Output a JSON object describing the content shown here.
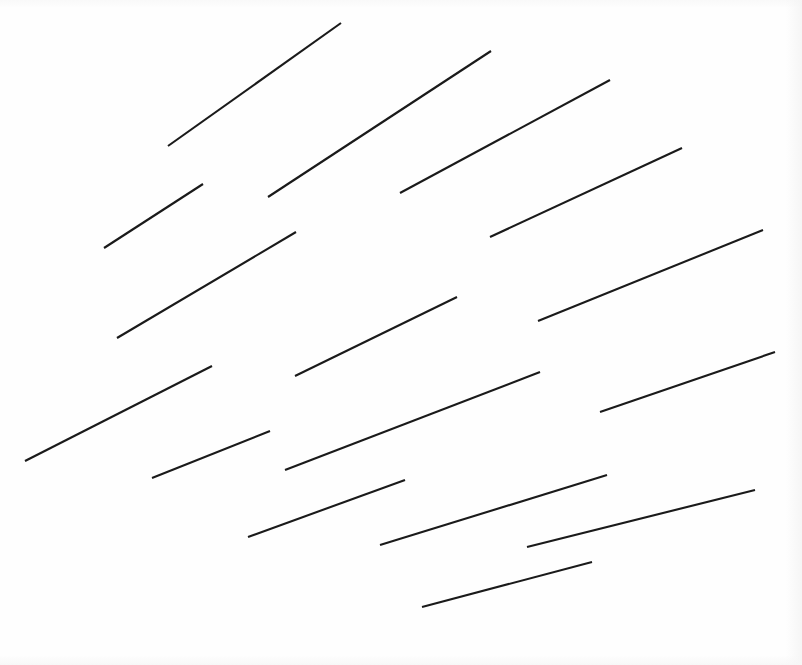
{
  "figure": {
    "width": 802,
    "height": 665,
    "background_color": "#FEFEFE",
    "stroke_color": "#1A1A1A",
    "stroke_width": 2.1,
    "segment_count": 16
  },
  "chart_data": {
    "type": "scatter",
    "subtitle": "",
    "xlabel": "",
    "ylabel": "",
    "xlim": [
      0,
      802
    ],
    "ylim": [
      0,
      665
    ],
    "grid": false,
    "legend": "none",
    "annotations": [],
    "tick_labels": {
      "x": [],
      "y": []
    },
    "series": [
      {
        "name": "line-segments",
        "marker": "none",
        "linestyle": "solid",
        "color": "#1A1A1A",
        "segments": [
          {
            "id": 1,
            "x1": 168,
            "y1": 146,
            "x2": 341,
            "y2": 23,
            "length": 212,
            "angle_deg": -35.4
          },
          {
            "id": 2,
            "x1": 268,
            "y1": 197,
            "x2": 491,
            "y2": 51,
            "length": 266,
            "angle_deg": -33.2
          },
          {
            "id": 3,
            "x1": 400,
            "y1": 193,
            "x2": 610,
            "y2": 80,
            "length": 238,
            "angle_deg": -28.3
          },
          {
            "id": 4,
            "x1": 104,
            "y1": 248,
            "x2": 203,
            "y2": 184,
            "length": 118,
            "angle_deg": -32.9
          },
          {
            "id": 5,
            "x1": 117,
            "y1": 338,
            "x2": 296,
            "y2": 232,
            "length": 208,
            "angle_deg": -30.6
          },
          {
            "id": 6,
            "x1": 490,
            "y1": 237,
            "x2": 682,
            "y2": 148,
            "length": 212,
            "angle_deg": -24.9
          },
          {
            "id": 7,
            "x1": 25,
            "y1": 461,
            "x2": 212,
            "y2": 366,
            "length": 210,
            "angle_deg": -26.9
          },
          {
            "id": 8,
            "x1": 295,
            "y1": 376,
            "x2": 457,
            "y2": 297,
            "length": 180,
            "angle_deg": -26.0
          },
          {
            "id": 9,
            "x1": 538,
            "y1": 321,
            "x2": 763,
            "y2": 230,
            "length": 243,
            "angle_deg": -22.0
          },
          {
            "id": 10,
            "x1": 152,
            "y1": 478,
            "x2": 270,
            "y2": 431,
            "length": 127,
            "angle_deg": -21.7
          },
          {
            "id": 11,
            "x1": 285,
            "y1": 470,
            "x2": 540,
            "y2": 372,
            "length": 273,
            "angle_deg": -21.0
          },
          {
            "id": 12,
            "x1": 600,
            "y1": 412,
            "x2": 775,
            "y2": 352,
            "length": 185,
            "angle_deg": -18.9
          },
          {
            "id": 13,
            "x1": 248,
            "y1": 537,
            "x2": 405,
            "y2": 480,
            "length": 167,
            "angle_deg": -19.9
          },
          {
            "id": 14,
            "x1": 380,
            "y1": 545,
            "x2": 607,
            "y2": 475,
            "length": 238,
            "angle_deg": -17.1
          },
          {
            "id": 15,
            "x1": 527,
            "y1": 547,
            "x2": 755,
            "y2": 490,
            "length": 235,
            "angle_deg": -14.0
          },
          {
            "id": 16,
            "x1": 422,
            "y1": 607,
            "x2": 592,
            "y2": 562,
            "length": 176,
            "angle_deg": -14.8
          }
        ]
      }
    ]
  }
}
